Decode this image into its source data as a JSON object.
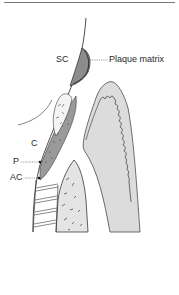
{
  "figure": {
    "type": "periodontal-anatomy-diagram",
    "labels": {
      "sc": "SC",
      "plaque_matrix": "Plaque matrix",
      "c": "C",
      "p": "P",
      "ac": "AC"
    },
    "colors": {
      "stroke": "#3a3a3a",
      "plaque_fill": "#8c8c8c",
      "gingiva_fill": "#dcdcdc",
      "calculus_fill": "#9a9a9a",
      "bone_fill": "#e4e4e4",
      "background": "#ffffff",
      "top_rule": "#7a7a7a"
    }
  }
}
